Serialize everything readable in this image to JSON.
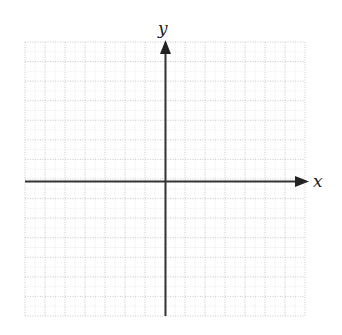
{
  "diagram": {
    "type": "cartesian-coordinate-plane",
    "x_axis_label": "x",
    "y_axis_label": "y",
    "grid": {
      "columns": 14,
      "rows": 14,
      "columns_left_of_y_axis": 7,
      "columns_right_of_y_axis": 7,
      "rows_above_x_axis": 7,
      "rows_below_x_axis": 7,
      "line_style": "dotted",
      "line_color": "#bdbdbd"
    },
    "axis_color": "#333333",
    "arrows": [
      "positive-x",
      "positive-y"
    ]
  }
}
